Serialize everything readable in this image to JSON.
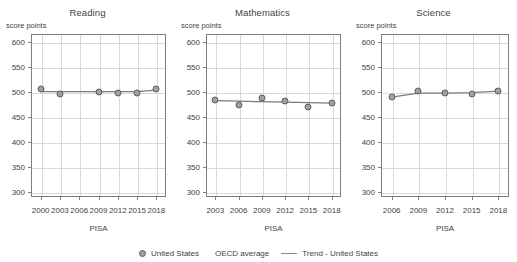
{
  "figure": {
    "y_axis_unit_label": "score points",
    "x_axis_title": "PISA"
  },
  "legend": {
    "series_label": "United States",
    "series_marker": "filled-circle-marker",
    "oecd_label": "OECD average",
    "oecd_marker": "none",
    "trend_label": "Trend - United States",
    "trend_marker": "solid-line"
  },
  "colors": {
    "marker_fill": "#a0a0a0",
    "marker_edge": "#5e5e5e",
    "trend_line": "#7a7a84",
    "grid": "#d8d8dd",
    "axis": "#7d7d7d",
    "text": "#3f3f3f",
    "background": "#ffffff"
  },
  "panel_titles": {
    "reading": "Reading",
    "mathematics": "Mathematics",
    "science": "Science"
  },
  "chart_data": [
    {
      "type": "line",
      "title": "Reading",
      "xlabel": "PISA",
      "ylabel": "score points",
      "ylim": [
        290,
        615
      ],
      "yticks": [
        300,
        350,
        400,
        450,
        500,
        550,
        600
      ],
      "xticks": [
        2000,
        2003,
        2006,
        2009,
        2012,
        2015,
        2018
      ],
      "xlim": [
        1998.5,
        2019.5
      ],
      "grid": true,
      "legend_position": "bottom-center-shared",
      "series": [
        {
          "name": "United States",
          "marker": "circle",
          "x": [
            2000,
            2003,
            2009,
            2012,
            2015,
            2018
          ],
          "values": [
            505,
            495,
            500,
            498,
            497,
            505
          ]
        },
        {
          "name": "Trend - United States",
          "marker": "line",
          "x": [
            2000,
            2003,
            2009,
            2012,
            2015,
            2018
          ],
          "values": [
            500,
            500,
            500,
            500,
            500,
            503
          ]
        }
      ]
    },
    {
      "type": "line",
      "title": "Mathematics",
      "xlabel": "PISA",
      "ylabel": "score points",
      "ylim": [
        290,
        615
      ],
      "yticks": [
        300,
        350,
        400,
        450,
        500,
        550,
        600
      ],
      "xticks": [
        2003,
        2006,
        2009,
        2012,
        2015,
        2018
      ],
      "xlim": [
        2001.8,
        2019.2
      ],
      "grid": true,
      "legend_position": "bottom-center-shared",
      "series": [
        {
          "name": "United States",
          "marker": "circle",
          "x": [
            2003,
            2006,
            2009,
            2012,
            2015,
            2018
          ],
          "values": [
            483,
            474,
            487,
            481,
            470,
            478
          ]
        },
        {
          "name": "Trend - United States",
          "marker": "line",
          "x": [
            2003,
            2006,
            2009,
            2012,
            2015,
            2018
          ],
          "values": [
            482,
            481,
            480,
            479,
            478,
            477
          ]
        }
      ]
    },
    {
      "type": "line",
      "title": "Science",
      "xlabel": "PISA",
      "ylabel": "score points",
      "ylim": [
        290,
        615
      ],
      "yticks": [
        300,
        350,
        400,
        450,
        500,
        550,
        600
      ],
      "xticks": [
        2006,
        2009,
        2012,
        2015,
        2018
      ],
      "xlim": [
        2004.8,
        2019.2
      ],
      "grid": true,
      "legend_position": "bottom-center-shared",
      "series": [
        {
          "name": "United States",
          "marker": "circle",
          "x": [
            2006,
            2009,
            2012,
            2015,
            2018
          ],
          "values": [
            489,
            502,
            497,
            496,
            502
          ]
        },
        {
          "name": "Trend - United States",
          "marker": "line",
          "x": [
            2006,
            2009,
            2012,
            2015,
            2018
          ],
          "values": [
            489,
            497,
            497,
            498,
            501
          ]
        }
      ]
    }
  ]
}
